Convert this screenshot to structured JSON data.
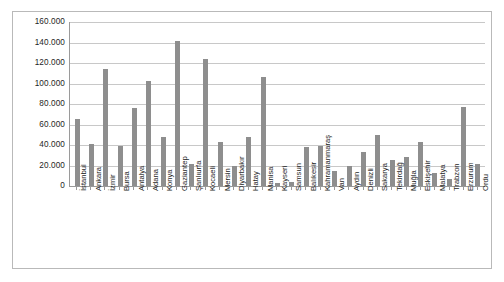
{
  "chart_data": {
    "type": "bar",
    "title": "",
    "subtitle": "",
    "xlabel": "",
    "ylabel": "",
    "ylim": [
      0,
      160000
    ],
    "ytick_step": 20000,
    "ytick_labels": [
      "160.000",
      "140.000",
      "120.000",
      "100.000",
      "80.000",
      "60.000",
      "40.000",
      "20.000",
      "0"
    ],
    "ytick_values": [
      160000,
      140000,
      120000,
      100000,
      80000,
      60000,
      40000,
      20000,
      0
    ],
    "grid": true,
    "legend": false,
    "bar_color": "#8e8e8e",
    "categories": [
      "İstanbul",
      "Ankara",
      "İzmir",
      "Bursa",
      "Antalya",
      "Adana",
      "Konya",
      "Gaziantep",
      "Şanlıurfa",
      "Kocaeli",
      "Mersin",
      "Diyarbakır",
      "Hatay",
      "Manisa",
      "Kayseri",
      "Samsun",
      "Balıkesir",
      "Kahramanmaraş",
      "Van",
      "Aydın",
      "Denizli",
      "Sakarya",
      "Tekirdağ",
      "Muğla",
      "Eskişehir",
      "Malatya",
      "Trabzon",
      "Erzurum",
      "Ordu"
    ],
    "values": [
      65000,
      41000,
      114000,
      39000,
      76000,
      102000,
      48000,
      141000,
      21000,
      124000,
      43000,
      20000,
      48000,
      106000,
      3000,
      4000,
      38000,
      39000,
      15000,
      20000,
      33000,
      50000,
      25000,
      28000,
      43000,
      13000,
      7000,
      77000,
      21000
    ]
  }
}
